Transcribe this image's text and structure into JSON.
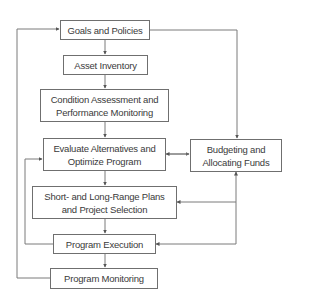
{
  "diagram": {
    "title": "",
    "nodes": [
      {
        "id": "goals",
        "label_lines": [
          "Goals and Policies"
        ]
      },
      {
        "id": "asset",
        "label_lines": [
          "Asset Inventory"
        ]
      },
      {
        "id": "condition",
        "label_lines": [
          "Condition Assessment and",
          "Performance Monitoring"
        ]
      },
      {
        "id": "evaluate",
        "label_lines": [
          "Evaluate Alternatives and",
          "Optimize Program"
        ]
      },
      {
        "id": "budget",
        "label_lines": [
          "Budgeting and",
          "Allocating Funds"
        ]
      },
      {
        "id": "plans",
        "label_lines": [
          "Short- and Long-Range Plans",
          "and Project Selection"
        ]
      },
      {
        "id": "execution",
        "label_lines": [
          "Program Execution"
        ]
      },
      {
        "id": "monitoring",
        "label_lines": [
          "Program Monitoring"
        ]
      }
    ],
    "edges": [
      {
        "from": "goals",
        "to": "asset"
      },
      {
        "from": "asset",
        "to": "condition"
      },
      {
        "from": "condition",
        "to": "evaluate"
      },
      {
        "from": "evaluate",
        "to": "plans"
      },
      {
        "from": "plans",
        "to": "execution"
      },
      {
        "from": "execution",
        "to": "monitoring"
      },
      {
        "from": "goals",
        "to": "budget"
      },
      {
        "from": "evaluate",
        "to": "budget",
        "bidirectional": true
      },
      {
        "from": "budget",
        "to": "plans"
      },
      {
        "from": "budget",
        "to": "execution"
      },
      {
        "from": "execution",
        "to": "evaluate",
        "note": "feedback loop"
      },
      {
        "from": "monitoring",
        "to": "goals",
        "note": "feedback loop"
      }
    ],
    "colors": {
      "line": "#6f6f6f",
      "text": "#3a3a3a",
      "box_border": "#6f6f6f"
    }
  }
}
